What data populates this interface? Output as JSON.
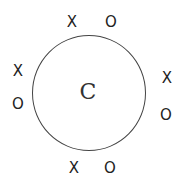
{
  "center_label": "C",
  "marks": {
    "top": [
      "X",
      "O"
    ],
    "left": [
      "X",
      "O"
    ],
    "right": [
      "X",
      "O"
    ],
    "bottom": [
      "X",
      "O"
    ]
  }
}
